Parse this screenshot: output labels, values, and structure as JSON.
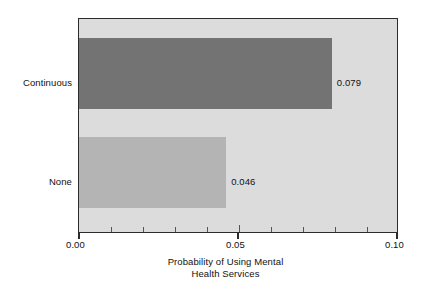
{
  "chart_data": {
    "type": "bar",
    "orientation": "horizontal",
    "title": "",
    "xlabel_line1": "Probability of Using Mental",
    "xlabel_line2": "Health Services",
    "ylabel": "",
    "categories": [
      "Continuous",
      "None"
    ],
    "values": [
      0.079,
      0.046
    ],
    "value_labels": [
      "0.079",
      "0.046"
    ],
    "xlim": [
      0.0,
      0.1
    ],
    "xticks": [
      0.0,
      0.05,
      0.1
    ],
    "xtick_labels": [
      "0.00",
      "0.05",
      "0.10"
    ],
    "xminor_step": 0.01,
    "grid": false,
    "legend": "none",
    "series": [
      {
        "name": "Continuous",
        "value": 0.079,
        "label": "0.079",
        "color": "#737373"
      },
      {
        "name": "None",
        "value": 0.046,
        "label": "0.046",
        "color": "#b4b4b4"
      }
    ],
    "colors": {
      "plot_background": "#dcdcdc",
      "page_background": "#ffffff",
      "frame": "#2b2b2b",
      "bar_continuous": "#737373",
      "bar_none": "#b4b4b4",
      "text": "#111111"
    }
  }
}
